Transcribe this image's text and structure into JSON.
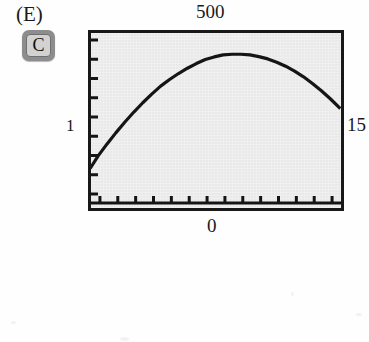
{
  "figure": {
    "panel_label": "(E)",
    "calculator_key": {
      "label": "C",
      "icon": "calculator-key-c"
    }
  },
  "chart_data": {
    "type": "line",
    "title": "",
    "subtitle": "",
    "xlabel": "",
    "ylabel": "",
    "axis_labels": {
      "top": "500",
      "left": "1",
      "right": "15",
      "bottom": "0"
    },
    "xlim": [
      1,
      15
    ],
    "ylim": [
      0,
      500
    ],
    "grid": false,
    "legend": null,
    "x_tick_count": 14,
    "y_tick_count": 9,
    "series": [
      {
        "name": "curve",
        "x": [
          1.0,
          1.4,
          1.9,
          2.4,
          2.9,
          3.4,
          3.9,
          4.4,
          4.9,
          5.4,
          5.9,
          6.4,
          6.9,
          7.4,
          7.9,
          8.4,
          8.9,
          9.4,
          9.9,
          10.4,
          10.9,
          11.4,
          11.9,
          12.4,
          12.9,
          13.4,
          13.9,
          14.4,
          14.9
        ],
        "y": [
          108,
          142,
          178,
          212,
          244,
          274,
          302,
          328,
          352,
          372,
          390,
          406,
          420,
          432,
          440,
          446,
          448,
          448,
          446,
          441,
          434,
          424,
          412,
          397,
          380,
          360,
          338,
          314,
          288
        ]
      }
    ],
    "colors": {
      "curve": "#151515",
      "frame": "#181818",
      "screen_background": "#e9e9e9",
      "page_background": "#ffffff"
    }
  }
}
